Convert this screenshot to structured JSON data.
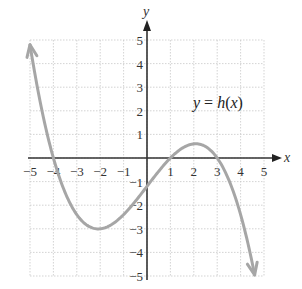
{
  "chart_data": {
    "type": "line",
    "title": "",
    "xlabel": "x",
    "ylabel": "y",
    "xlim": [
      -5,
      5
    ],
    "ylim": [
      -5,
      5
    ],
    "grid": true,
    "x_ticks": [
      "-5",
      "-4",
      "-3",
      "-2",
      "-1",
      "1",
      "2",
      "3",
      "4",
      "5"
    ],
    "y_ticks": [
      "5",
      "4",
      "3",
      "2",
      "1",
      "-1",
      "-2",
      "-3",
      "-4",
      "-5"
    ],
    "annotations": [
      {
        "text": "y = h(x)",
        "x": 3,
        "y": 2
      }
    ],
    "series": [
      {
        "name": "y = h(x)",
        "description": "cubic with arrows at both ends",
        "points": [
          {
            "x": -5,
            "y": 5
          },
          {
            "x": -4,
            "y": 0
          },
          {
            "x": -3,
            "y": -2.2
          },
          {
            "x": -2,
            "y": -3
          },
          {
            "x": -1,
            "y": -2.5
          },
          {
            "x": 0,
            "y": -1.2
          },
          {
            "x": 1,
            "y": 0
          },
          {
            "x": 2,
            "y": 0.5
          },
          {
            "x": 3,
            "y": 0
          },
          {
            "x": 4,
            "y": -2.5
          },
          {
            "x": 4.6,
            "y": -5
          }
        ],
        "x_intercepts": [
          -4,
          1,
          3
        ],
        "local_min": {
          "x": -2,
          "y": -3
        },
        "local_max": {
          "x": 2,
          "y": 0.5
        },
        "color": "#a6a6a6"
      }
    ]
  },
  "labels": {
    "x_axis": "x",
    "y_axis": "y",
    "function": "y = h(x)"
  }
}
